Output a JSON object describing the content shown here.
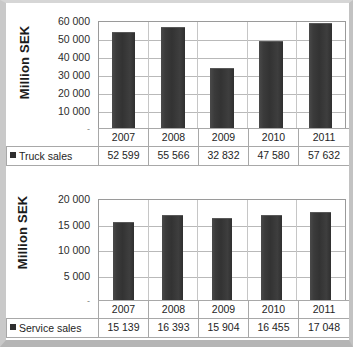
{
  "charts": [
    {
      "id": "truck-sales-chart",
      "axis_title": "Million SEK",
      "y_ticks": [
        "60 000",
        "50 000",
        "40 000",
        "30 000",
        "20 000",
        "10 000",
        "-"
      ],
      "series_label": "Truck sales",
      "categories": [
        "2007",
        "2008",
        "2009",
        "2010",
        "2011"
      ],
      "value_labels": [
        "52 599",
        "55 566",
        "32 832",
        "47 580",
        "57 632"
      ]
    },
    {
      "id": "service-sales-chart",
      "axis_title": "Million SEK",
      "y_ticks": [
        "20 000",
        "15 000",
        "10 000",
        "5 000",
        "-"
      ],
      "series_label": "Service sales",
      "categories": [
        "2007",
        "2008",
        "2009",
        "2010",
        "2011"
      ],
      "value_labels": [
        "15 139",
        "16 393",
        "15 904",
        "16 455",
        "17 048"
      ]
    }
  ],
  "chart_data": [
    {
      "type": "bar",
      "title": "Truck sales",
      "xlabel": "",
      "ylabel": "Million SEK",
      "categories": [
        "2007",
        "2008",
        "2009",
        "2010",
        "2011"
      ],
      "values": [
        52599,
        55566,
        32832,
        47580,
        57632
      ],
      "value_labels": [
        "52 599",
        "55 566",
        "32 832",
        "47 580",
        "57 632"
      ],
      "ylim": [
        0,
        60000
      ],
      "ytick_values": [
        0,
        10000,
        20000,
        30000,
        40000,
        50000,
        60000
      ],
      "ytick_labels": [
        "-",
        "10 000",
        "20 000",
        "30 000",
        "40 000",
        "50 000",
        "60 000"
      ],
      "grid": true,
      "legend": "bottom-table",
      "series": [
        {
          "name": "Truck sales",
          "values": [
            52599,
            55566,
            32832,
            47580,
            57632
          ]
        }
      ],
      "bar_color": "#333333"
    },
    {
      "type": "bar",
      "title": "Service sales",
      "xlabel": "",
      "ylabel": "Million SEK",
      "categories": [
        "2007",
        "2008",
        "2009",
        "2010",
        "2011"
      ],
      "values": [
        15139,
        16393,
        15904,
        16455,
        17048
      ],
      "value_labels": [
        "15 139",
        "16 393",
        "15 904",
        "16 455",
        "17 048"
      ],
      "ylim": [
        0,
        20000
      ],
      "ytick_values": [
        0,
        5000,
        10000,
        15000,
        20000
      ],
      "ytick_labels": [
        "-",
        "5 000",
        "10 000",
        "15 000",
        "20 000"
      ],
      "grid": true,
      "legend": "bottom-table",
      "series": [
        {
          "name": "Service sales",
          "values": [
            15139,
            16393,
            15904,
            16455,
            17048
          ]
        }
      ],
      "bar_color": "#333333"
    }
  ]
}
